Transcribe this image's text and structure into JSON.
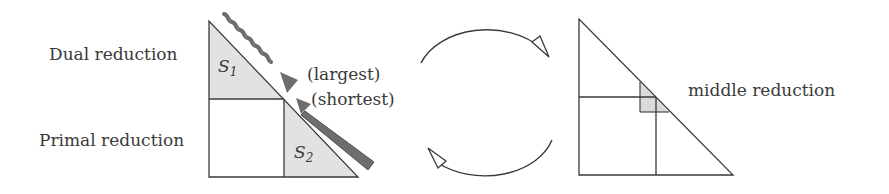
{
  "diagram": {
    "left_panel": {
      "labels": {
        "dual": "Dual reduction",
        "primal": "Primal reduction"
      },
      "regions": {
        "s1": {
          "symbol": "S",
          "subscript": "1"
        },
        "s2": {
          "symbol": "S",
          "subscript": "2"
        }
      },
      "arrow_annotations": {
        "wavy": "(largest)",
        "straight": "(shortest)"
      }
    },
    "cycle_arrows": {
      "top": "clockwise arc to right panel",
      "bottom": "arc back to left panel"
    },
    "right_panel": {
      "label": "middle reduction"
    },
    "colors": {
      "line": "#3a3a3a",
      "shade": "#e2e2e2",
      "arrow_fill": "#6e6e6e",
      "background": "#ffffff"
    }
  }
}
